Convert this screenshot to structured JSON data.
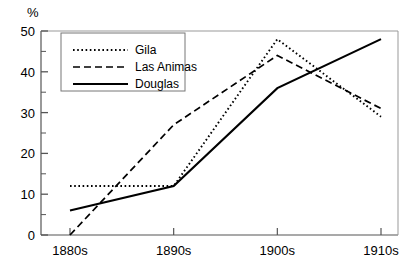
{
  "chart_data": {
    "type": "line",
    "title": "",
    "subtitle": "",
    "xlabel": "",
    "ylabel": "%",
    "categories": [
      "1880s",
      "1890s",
      "1900s",
      "1910s"
    ],
    "x_tick_labels": [
      "1880s",
      "1890s",
      "1900s",
      "1910s"
    ],
    "y_tick_labels": [
      "0",
      "10",
      "20",
      "30",
      "40",
      "50"
    ],
    "y_ticks_major": [
      0,
      10,
      20,
      30,
      40,
      50
    ],
    "y_minor_tick_interval": 5,
    "ylim": [
      0,
      50
    ],
    "xlim": [
      0,
      3
    ],
    "grid": false,
    "legend_position": "upper-left-inside",
    "series": [
      {
        "name": "Gila",
        "style": "dotted",
        "color": "#000000",
        "values": [
          12,
          12,
          48,
          29
        ]
      },
      {
        "name": "Las Animas",
        "style": "dashed",
        "color": "#000000",
        "values": [
          0,
          27,
          44,
          31
        ]
      },
      {
        "name": "Douglas",
        "style": "solid",
        "color": "#000000",
        "values": [
          6,
          12,
          36,
          48
        ]
      }
    ]
  },
  "legend": {
    "entries": [
      {
        "label": "Gila",
        "sample": "dotted-line-sample"
      },
      {
        "label": "Las Animas",
        "sample": "dashed-line-sample"
      },
      {
        "label": "Douglas",
        "sample": "solid-line-sample"
      }
    ]
  },
  "axes": {
    "y_axis_unit_label": "%"
  },
  "colors": {
    "line": "#111111",
    "axis": "#555555",
    "legend_border": "#777777",
    "background": "#ffffff"
  }
}
